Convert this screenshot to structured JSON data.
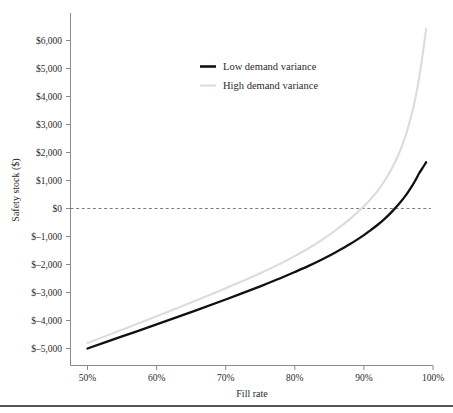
{
  "chart_data": {
    "type": "line",
    "title": "",
    "xlabel": "Fill rate",
    "ylabel": "Safety stock ($)",
    "xlim": [
      50,
      100
    ],
    "ylim": [
      -5000,
      6500
    ],
    "grid": false,
    "legend_position": "top-center",
    "x_tick_labels": [
      "50%",
      "60%",
      "70%",
      "80%",
      "90%",
      "100%"
    ],
    "x_tick_values": [
      50,
      60,
      70,
      80,
      90,
      100
    ],
    "y_tick_labels": [
      "$6,000",
      "$5,000",
      "$4,000",
      "$3,000",
      "$2,000",
      "$1,000",
      "$0",
      "$–1,000",
      "$–2,000",
      "$–3,000",
      "$–4,000",
      "$–5,000"
    ],
    "y_tick_values": [
      6000,
      5000,
      4000,
      3000,
      2000,
      1000,
      0,
      -1000,
      -2000,
      -3000,
      -4000,
      -5000
    ],
    "annotations": [
      {
        "name": "zero-reference-line",
        "type": "hline",
        "value": 0,
        "style": "dashed"
      }
    ],
    "x": [
      50,
      55,
      60,
      65,
      70,
      75,
      78,
      80,
      82,
      84,
      86,
      88,
      90,
      91,
      92,
      93,
      94,
      95,
      96,
      97,
      97.5,
      98,
      98.5,
      99
    ],
    "series": [
      {
        "name": "Low demand variance",
        "color": "#111111",
        "width": "thick",
        "values": [
          -5000,
          -4570,
          -4140,
          -3700,
          -3250,
          -2780,
          -2480,
          -2270,
          -2050,
          -1810,
          -1550,
          -1270,
          -950,
          -770,
          -580,
          -370,
          -130,
          140,
          450,
          820,
          1030,
          1260,
          1450,
          1650
        ]
      },
      {
        "name": "High demand variance",
        "color": "#dcdcdc",
        "width": "thin",
        "values": [
          -4800,
          -4330,
          -3850,
          -3360,
          -2850,
          -2310,
          -1960,
          -1700,
          -1420,
          -1110,
          -760,
          -370,
          80,
          340,
          640,
          990,
          1410,
          1920,
          2570,
          3450,
          4000,
          4680,
          5500,
          6400
        ]
      }
    ]
  },
  "legend": {
    "items": [
      {
        "label": "Low demand variance"
      },
      {
        "label": "High demand variance"
      }
    ]
  },
  "axes": {
    "y_title": "Safety stock ($)",
    "x_title": "Fill rate"
  }
}
